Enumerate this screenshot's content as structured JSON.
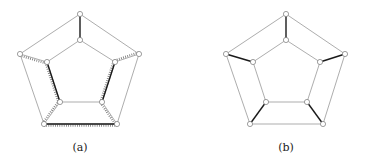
{
  "figures": [
    {
      "id": "a",
      "caption": "(a)",
      "caption_pos": [
        80,
        141
      ],
      "vertices": {
        "o0": [
          80,
          14
        ],
        "o1": [
          139,
          54
        ],
        "o2": [
          117,
          124
        ],
        "o3": [
          44,
          124
        ],
        "o4": [
          20,
          54
        ],
        "i0": [
          80,
          40
        ],
        "i1": [
          115,
          62
        ],
        "i2": [
          102,
          102
        ],
        "i3": [
          60,
          102
        ],
        "i4": [
          47,
          62
        ]
      },
      "thin_edges": [
        [
          "o0",
          "o1"
        ],
        [
          "o1",
          "o2"
        ],
        [
          "o3",
          "o4"
        ],
        [
          "o4",
          "o0"
        ],
        [
          "i0",
          "i1"
        ],
        [
          "i2",
          "i3"
        ],
        [
          "i4",
          "i0"
        ]
      ],
      "bold_edges": [
        [
          "o0",
          "i0"
        ],
        [
          "i4",
          "i3"
        ],
        [
          "i1",
          "i2"
        ],
        [
          "o3",
          "o2"
        ]
      ],
      "hatched_edges": [
        [
          "o4",
          "i4"
        ],
        [
          "o1",
          "i1"
        ],
        [
          "i4",
          "i3"
        ],
        [
          "i1",
          "i2"
        ],
        [
          "i3",
          "o3"
        ],
        [
          "i2",
          "o2"
        ],
        [
          "o3",
          "o2"
        ]
      ]
    },
    {
      "id": "b",
      "caption": "(b)",
      "caption_pos": [
        286,
        141
      ],
      "vertices": {
        "o0": [
          286,
          14
        ],
        "o1": [
          345,
          54
        ],
        "o2": [
          323,
          124
        ],
        "o3": [
          250,
          124
        ],
        "o4": [
          226,
          54
        ],
        "i0": [
          286,
          40
        ],
        "i1": [
          320,
          62
        ],
        "i2": [
          307,
          102
        ],
        "i3": [
          266,
          102
        ],
        "i4": [
          253,
          62
        ]
      },
      "thin_edges": [
        [
          "o0",
          "o1"
        ],
        [
          "o1",
          "o2"
        ],
        [
          "o2",
          "o3"
        ],
        [
          "o3",
          "o4"
        ],
        [
          "o4",
          "o0"
        ],
        [
          "i0",
          "i1"
        ],
        [
          "i1",
          "i2"
        ],
        [
          "i2",
          "i3"
        ],
        [
          "i3",
          "i4"
        ],
        [
          "i4",
          "i0"
        ]
      ],
      "bold_edges": [
        [
          "o0",
          "i0"
        ],
        [
          "o1",
          "i1"
        ],
        [
          "o2",
          "i2"
        ],
        [
          "o3",
          "i3"
        ],
        [
          "o4",
          "i4"
        ]
      ],
      "hatched_edges": []
    }
  ],
  "colors": {
    "thin": "#8a8a8a",
    "bold": "#1a1a1a",
    "hatch": "#777777",
    "vertex_fill": "#ffffff",
    "vertex_stroke": "#777777"
  }
}
